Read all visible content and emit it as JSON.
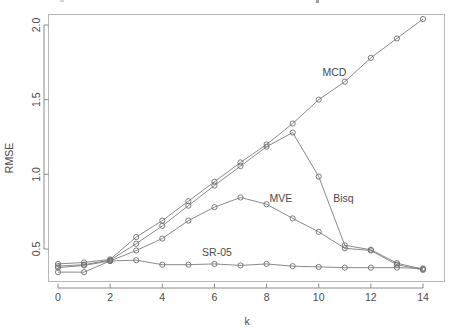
{
  "figure": {
    "width": 453,
    "height": 331,
    "background": "#ffffff",
    "line_color": "#7d7d7d",
    "point_color": "#6e6e6e",
    "axis_color": "#8a8a8a",
    "frame_color": "#b8b8b8",
    "text_color": "#4a4a4a"
  },
  "chart_data": {
    "type": "line",
    "title": "",
    "subtitle": "",
    "xlabel": "k",
    "ylabel": "RMSE",
    "xlim": [
      -0.45,
      14.45
    ],
    "ylim": [
      0.29,
      2.12
    ],
    "grid": false,
    "legend": "inline-annotations",
    "marker": "open-circle",
    "x": [
      0,
      1,
      2,
      3,
      4,
      5,
      6,
      7,
      8,
      9,
      10,
      11,
      12,
      13,
      14
    ],
    "xticks": [
      0,
      2,
      4,
      6,
      8,
      10,
      12,
      14
    ],
    "xtick_labels": [
      "0",
      "2",
      "4",
      "6",
      "8",
      "10",
      "12",
      "14"
    ],
    "yticks": [
      0.5,
      1.0,
      1.5,
      2.0
    ],
    "ytick_labels": [
      "0.5",
      "1.0",
      "1.5",
      "2.0"
    ],
    "series": [
      {
        "name": "MCD",
        "label": "MCD",
        "label_x": 10.6,
        "label_y": 1.66,
        "values": [
          0.4,
          0.41,
          0.43,
          0.58,
          0.69,
          0.82,
          0.95,
          1.08,
          1.2,
          1.34,
          1.5,
          1.62,
          1.78,
          1.91,
          2.04
        ]
      },
      {
        "name": "Bisq",
        "label": "Bisq",
        "label_x": 10.95,
        "label_y": 0.815,
        "values": [
          0.385,
          0.395,
          0.425,
          0.535,
          0.655,
          0.79,
          0.925,
          1.055,
          1.185,
          1.28,
          0.985,
          0.525,
          0.495,
          0.405,
          0.365
        ]
      },
      {
        "name": "MVE",
        "label": "MVE",
        "label_x": 8.55,
        "label_y": 0.815,
        "values": [
          0.345,
          0.345,
          0.42,
          0.49,
          0.57,
          0.69,
          0.78,
          0.845,
          0.8,
          0.705,
          0.615,
          0.505,
          0.49,
          0.395,
          0.36
        ]
      },
      {
        "name": "SR-05",
        "label": "SR-05",
        "label_x": 6.1,
        "label_y": 0.455,
        "values": [
          0.375,
          0.39,
          0.42,
          0.425,
          0.395,
          0.395,
          0.4,
          0.39,
          0.4,
          0.385,
          0.38,
          0.375,
          0.375,
          0.375,
          0.37
        ]
      }
    ]
  }
}
